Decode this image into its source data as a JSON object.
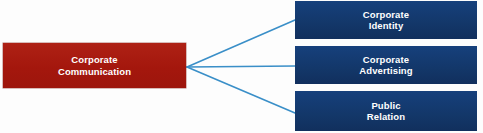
{
  "diagram": {
    "type": "hierarchy-tree",
    "orientation": "left-to-right",
    "root": {
      "id": "corporate-communication",
      "label": "Corporate\nCommunication",
      "color": "#a81a10",
      "text_color": "#ffffff"
    },
    "children": [
      {
        "id": "corporate-identity",
        "label": "Corporate\nIdentity",
        "color": "#143a72",
        "text_color": "#ffffff"
      },
      {
        "id": "corporate-advertising",
        "label": "Corporate\nAdvertising",
        "color": "#143a72",
        "text_color": "#ffffff"
      },
      {
        "id": "public-relation",
        "label": "Public\nRelation",
        "color": "#143a72",
        "text_color": "#ffffff"
      }
    ],
    "connectors": {
      "color": "#3a8fc8",
      "style": "straight",
      "count": 3,
      "origin": {
        "x": 187,
        "y": 67
      }
    },
    "background_color": "#fdfdfd"
  }
}
